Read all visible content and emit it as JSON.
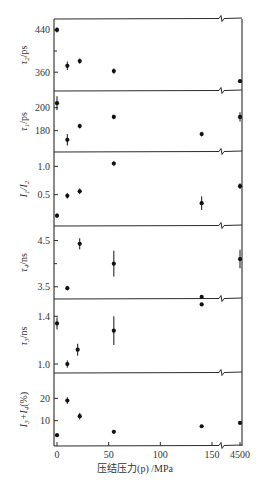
{
  "chart_data": {
    "type": "scatter",
    "title": "",
    "xlabel": "压结压力(p) /MPa",
    "x_ticks": [
      "0",
      "50",
      "100",
      "150",
      "4500"
    ],
    "x_axis_break": "between 150 and 4500",
    "grid": false,
    "panels": [
      {
        "ylabel": "τ2/ps",
        "ylim": [
          330,
          455
        ],
        "y_ticks": [
          360,
          440
        ],
        "minor_ticks": [
          400
        ],
        "points": [
          {
            "x": 0,
            "y": 440,
            "err": 5
          },
          {
            "x": 10,
            "y": 372,
            "err": 8
          },
          {
            "x": 22,
            "y": 381,
            "err": 5
          },
          {
            "x": 55,
            "y": 362,
            "err": 5
          },
          {
            "x": 4500,
            "y": 343,
            "err": 0
          }
        ]
      },
      {
        "ylabel": "τ1/ps",
        "ylim": [
          164,
          212
        ],
        "y_ticks": [
          180,
          200
        ],
        "minor_ticks": [],
        "points": [
          {
            "x": 0,
            "y": 204,
            "err": 6
          },
          {
            "x": 10,
            "y": 172,
            "err": 5
          },
          {
            "x": 22,
            "y": 184,
            "err": 2
          },
          {
            "x": 55,
            "y": 192,
            "err": 2
          },
          {
            "x": 140,
            "y": 177,
            "err": 2
          },
          {
            "x": 4500,
            "y": 192,
            "err": 4
          }
        ]
      },
      {
        "ylabel": "I1/I2",
        "ylim": [
          0,
          1.2
        ],
        "y_ticks": [
          0.5,
          1.0
        ],
        "minor_ticks": [],
        "points": [
          {
            "x": 0,
            "y": 0.13,
            "err": 0.04
          },
          {
            "x": 10,
            "y": 0.48,
            "err": 0.05
          },
          {
            "x": 22,
            "y": 0.56,
            "err": 0.05
          },
          {
            "x": 55,
            "y": 1.05,
            "err": 0.04
          },
          {
            "x": 140,
            "y": 0.35,
            "err": 0.12
          },
          {
            "x": 4500,
            "y": 0.65,
            "err": 0.05
          }
        ]
      },
      {
        "ylabel": "τ4/ns",
        "ylim": [
          3.3,
          4.75
        ],
        "y_ticks": [
          3.5,
          4.5
        ],
        "minor_ticks": [
          4.0
        ],
        "points": [
          {
            "x": 10,
            "y": 3.47,
            "err": 0.05
          },
          {
            "x": 22,
            "y": 4.43,
            "err": 0.12
          },
          {
            "x": 55,
            "y": 4.0,
            "err": 0.28
          },
          {
            "x": 140,
            "y": 3.28,
            "err": 0
          },
          {
            "x": 4500,
            "y": 4.1,
            "err": 0.2
          }
        ]
      },
      {
        "ylabel": "τ3/ns",
        "ylim": [
          0.95,
          1.52
        ],
        "y_ticks": [
          1.0,
          1.4
        ],
        "minor_ticks": [],
        "points": [
          {
            "x": 0,
            "y": 1.34,
            "err": 0.05
          },
          {
            "x": 10,
            "y": 1.0,
            "err": 0.03
          },
          {
            "x": 20,
            "y": 1.12,
            "err": 0.05
          },
          {
            "x": 55,
            "y": 1.28,
            "err": 0.12
          },
          {
            "x": 140,
            "y": 1.5,
            "err": 0
          }
        ]
      },
      {
        "ylabel": "I3+I4 (%)",
        "ylim": [
          0,
          30
        ],
        "y_ticks": [
          10,
          20
        ],
        "minor_ticks": [],
        "points": [
          {
            "x": 0,
            "y": 3.5,
            "err": 0.5
          },
          {
            "x": 10,
            "y": 19,
            "err": 1.5
          },
          {
            "x": 22,
            "y": 12,
            "err": 1.5
          },
          {
            "x": 55,
            "y": 5,
            "err": 0.5
          },
          {
            "x": 140,
            "y": 7.5,
            "err": 0.5
          },
          {
            "x": 4500,
            "y": 9,
            "err": 0.5
          }
        ]
      }
    ]
  },
  "labels": {
    "xlabel": "压结压力(p) /MPa",
    "panel_ylabels": [
      {
        "main": "τ",
        "sub": "2",
        "unit": "/ps"
      },
      {
        "main": "τ",
        "sub": "1",
        "unit": "/ps"
      },
      {
        "main": "I",
        "sub": "1",
        "mid": "/I",
        "sub2": "2",
        "unit": ""
      },
      {
        "main": "τ",
        "sub": "4",
        "unit": "/ns"
      },
      {
        "main": "τ",
        "sub": "3",
        "unit": "/ns"
      },
      {
        "main": "I",
        "sub": "3",
        "mid": "+I",
        "sub2": "4",
        "unit": "(%)"
      }
    ]
  }
}
